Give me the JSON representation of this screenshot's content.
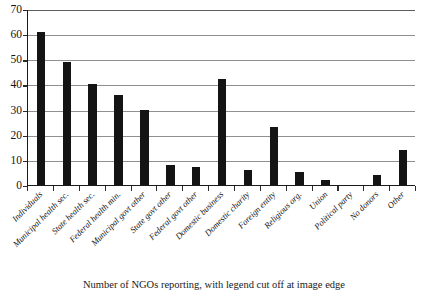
{
  "chart_data": {
    "type": "bar",
    "title": "",
    "xlabel": "",
    "ylabel": "",
    "ylim": [
      0,
      70
    ],
    "ytick_step": 10,
    "yticks": [
      "0",
      "10",
      "20",
      "30",
      "40",
      "50",
      "60",
      "70"
    ],
    "grid": true,
    "legend": "none",
    "bar_color": "#141414",
    "gridline_color": "#8f8f8f",
    "axis_color": "#1a1a1a",
    "categories": [
      "Individuals",
      "Municipal health sec.",
      "State health sec.",
      "Federal health min.",
      "Municipal govt other",
      "State govt other",
      "Federal govt other",
      "Domestic business",
      "Domestic charity",
      "Foreign entity",
      "Religious org.",
      "Union",
      "Political party",
      "No donors",
      "Other"
    ],
    "values": [
      61,
      49,
      40,
      36,
      30,
      8,
      7,
      42,
      6,
      23,
      5,
      2,
      0,
      4,
      14
    ]
  },
  "caption": {
    "text": "Number of NGOs reporting, with legend cut off at image edge"
  }
}
